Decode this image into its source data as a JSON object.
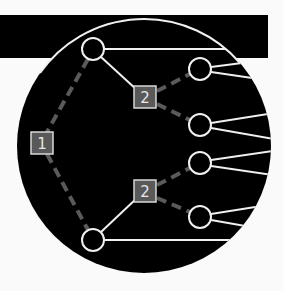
{
  "colors": {
    "background": "#fafafa",
    "shape": "#000000",
    "stroke": "#f0f0f0",
    "dashed": "#5a5a5a",
    "square_fill": "#595959"
  },
  "diagram": {
    "type": "tree",
    "bar": {
      "x": 0,
      "y": 15,
      "w": 268,
      "h": 43
    },
    "disc": {
      "cx": 144,
      "cy": 146,
      "r": 127
    },
    "squares": [
      {
        "id": "s1",
        "label": "1",
        "x": 42,
        "y": 143
      },
      {
        "id": "s2a",
        "label": "2",
        "x": 145,
        "y": 97
      },
      {
        "id": "s2b",
        "label": "2",
        "x": 145,
        "y": 191
      }
    ],
    "nodes": [
      {
        "id": "top",
        "x": 93,
        "y": 49
      },
      {
        "id": "bottom",
        "x": 93,
        "y": 240
      },
      {
        "id": "r1",
        "x": 200,
        "y": 69
      },
      {
        "id": "r2",
        "x": 200,
        "y": 125
      },
      {
        "id": "r3",
        "x": 200,
        "y": 163
      },
      {
        "id": "r4",
        "x": 200,
        "y": 217
      }
    ]
  }
}
